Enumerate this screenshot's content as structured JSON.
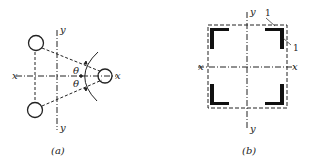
{
  "figure_a": {
    "caption": "(a)",
    "axis_x_left": "x",
    "axis_x_right": "x",
    "axis_y_top": "y",
    "axis_y_bottom": "y",
    "angle_top": "θ",
    "angle_bottom": "θ"
  },
  "figure_b": {
    "caption": "(b)",
    "axis_x_left": "x",
    "axis_x_right": "x",
    "axis_y_top": "y",
    "axis_y_bottom": "y",
    "label_1_top": "1",
    "label_1_right": "1"
  },
  "colors": {
    "stroke": "#222222"
  }
}
